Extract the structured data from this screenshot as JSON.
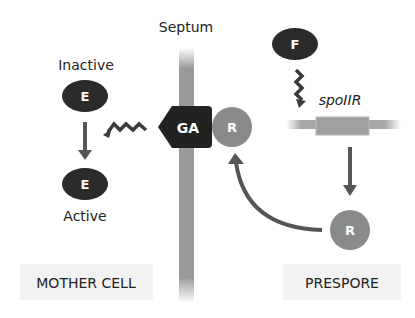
{
  "labels": {
    "septum": "Septum",
    "inactive": "Inactive",
    "active": "Active",
    "gene": "spoIIR",
    "mother_cell": "MOTHER CELL",
    "prespore": "PRESPORE"
  },
  "nodes": {
    "e_inactive": "E",
    "e_active": "E",
    "ga": "GA",
    "r_membrane": "R",
    "r_prespore": "R",
    "f": "F"
  },
  "colors": {
    "dark": "#2b2b2b",
    "mid_gray": "#8a8a8a",
    "septum_gray": "#9a9a9a",
    "arrow": "#555555",
    "label_bg": "#f2f2f2"
  }
}
